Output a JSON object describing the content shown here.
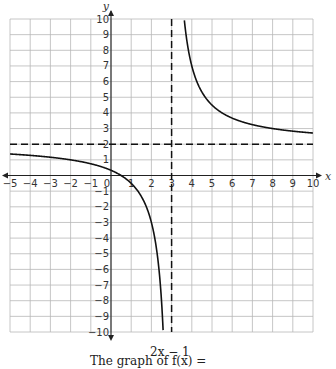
{
  "chart_data": {
    "type": "line",
    "title": "",
    "function": "f(x) = (2x - 1)/(x - 3)",
    "xlabel": "x",
    "ylabel": "y",
    "xlim": [
      -5,
      10
    ],
    "ylim": [
      -10,
      10
    ],
    "grid": true,
    "x_ticks": [
      -5,
      -4,
      -3,
      -2,
      -1,
      0,
      1,
      2,
      3,
      4,
      5,
      6,
      7,
      8,
      9,
      10
    ],
    "y_ticks": [
      -10,
      -9,
      -8,
      -7,
      -6,
      -5,
      -4,
      -3,
      -2,
      -1,
      1,
      2,
      3,
      4,
      5,
      6,
      7,
      8,
      9,
      10
    ],
    "asymptotes": [
      {
        "type": "vertical",
        "value": 3,
        "style": "dashed"
      },
      {
        "type": "horizontal",
        "value": 2,
        "style": "dashed"
      }
    ],
    "series": [
      {
        "name": "f(x) left branch",
        "x": [
          -5,
          -4,
          -3,
          -2,
          -1,
          0,
          0.5,
          1,
          2,
          2.5,
          2.6
        ],
        "values": [
          1.375,
          1.286,
          1.167,
          1.0,
          0.75,
          0.333,
          0,
          -0.5,
          -3,
          -8,
          -10.5
        ]
      },
      {
        "name": "f(x) right branch",
        "x": [
          3.7,
          4,
          5,
          6,
          7,
          8,
          9,
          10
        ],
        "values": [
          9.14,
          7,
          4.5,
          3.667,
          3.25,
          3.0,
          2.833,
          2.714
        ]
      }
    ]
  },
  "labels": {
    "x_axis": "x",
    "y_axis": "y",
    "origin": "0"
  },
  "caption": {
    "text": "The graph of  f(x) =",
    "numerator": "2x − 1"
  }
}
